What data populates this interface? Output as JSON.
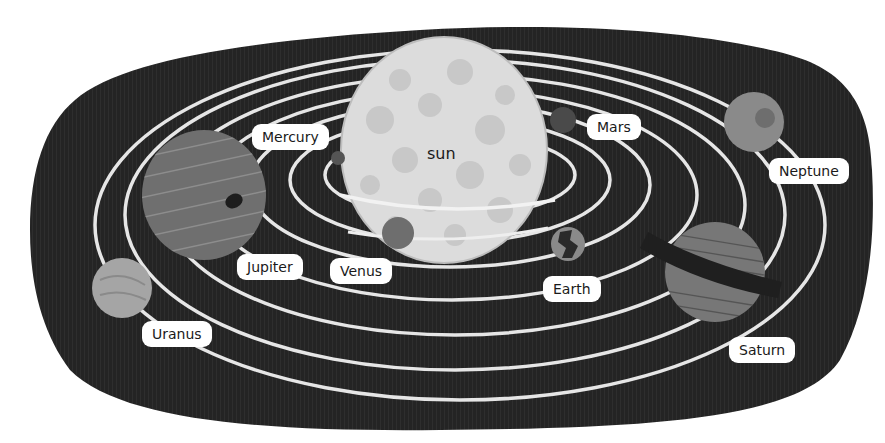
{
  "diagram": {
    "colors": {
      "background": "#ffffff",
      "space": "#232323",
      "orbit": "#e6e6e6",
      "sun": "#dcdcdc",
      "sun_spots": "#c6c6c6",
      "label_bg": "#ffffff",
      "label_text": "#1a1a1a"
    },
    "sun": {
      "label": "sun"
    },
    "planets": [
      {
        "id": "mercury",
        "label": "Mercury"
      },
      {
        "id": "venus",
        "label": "Venus"
      },
      {
        "id": "earth",
        "label": "Earth"
      },
      {
        "id": "mars",
        "label": "Mars"
      },
      {
        "id": "jupiter",
        "label": "Jupiter"
      },
      {
        "id": "saturn",
        "label": "Saturn"
      },
      {
        "id": "uranus",
        "label": "Uranus"
      },
      {
        "id": "neptune",
        "label": "Neptune"
      }
    ]
  }
}
